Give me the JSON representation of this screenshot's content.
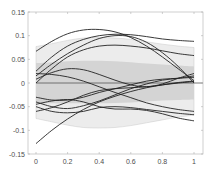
{
  "chart_data": {
    "type": "line",
    "title": "",
    "xlabel": "",
    "ylabel": "",
    "xlim": [
      0,
      1
    ],
    "ylim": [
      -0.15,
      0.15
    ],
    "grid": false,
    "legend": null,
    "x_ticks": [
      "0",
      "0.2",
      "0.4",
      "0.6",
      "0.8",
      "1"
    ],
    "y_ticks": [
      "0.15",
      "0.1",
      "0.05",
      "0",
      "-0.05",
      "-0.1",
      "-0.15"
    ],
    "colors": {
      "outer_band": "#ececec",
      "inner_band": "#d4d4d4",
      "lines": "#222222",
      "zero_line": "#555555",
      "axis": "#b0b0b0"
    },
    "x": [
      0,
      0.1,
      0.2,
      0.3,
      0.4,
      0.5,
      0.6,
      0.7,
      0.8,
      0.9,
      1.0
    ],
    "bands": {
      "outer_upper": [
        0.077,
        0.083,
        0.09,
        0.095,
        0.096,
        0.095,
        0.092,
        0.087,
        0.082,
        0.078,
        0.075
      ],
      "inner_upper": [
        0.042,
        0.044,
        0.046,
        0.047,
        0.047,
        0.046,
        0.044,
        0.041,
        0.039,
        0.037,
        0.035
      ],
      "inner_lower": [
        -0.042,
        -0.043,
        -0.043,
        -0.043,
        -0.043,
        -0.042,
        -0.041,
        -0.039,
        -0.037,
        -0.036,
        -0.035
      ],
      "outer_lower": [
        -0.075,
        -0.082,
        -0.089,
        -0.094,
        -0.095,
        -0.094,
        -0.09,
        -0.084,
        -0.078,
        -0.072,
        -0.068
      ]
    },
    "series": [
      {
        "name": "curve-1",
        "values": [
          0.067,
          0.088,
          0.104,
          0.112,
          0.113,
          0.108,
          0.096,
          0.078,
          0.055,
          0.03,
          0.005
        ]
      },
      {
        "name": "curve-2",
        "values": [
          0.025,
          0.055,
          0.078,
          0.092,
          0.1,
          0.103,
          0.102,
          0.098,
          0.093,
          0.09,
          0.088
        ]
      },
      {
        "name": "curve-3",
        "values": [
          0.015,
          0.04,
          0.062,
          0.08,
          0.094,
          0.1,
          0.098,
          0.086,
          0.064,
          0.035,
          0.0
        ]
      },
      {
        "name": "curve-4",
        "values": [
          0.0,
          0.03,
          0.055,
          0.07,
          0.078,
          0.08,
          0.078,
          0.074,
          0.068,
          0.062,
          0.058
        ]
      },
      {
        "name": "curve-5",
        "values": [
          0.02,
          0.018,
          0.013,
          0.004,
          -0.008,
          -0.02,
          -0.031,
          -0.042,
          -0.05,
          -0.056,
          -0.06
        ]
      },
      {
        "name": "curve-6",
        "values": [
          0.008,
          0.022,
          0.03,
          0.028,
          0.018,
          0.006,
          -0.004,
          -0.008,
          -0.002,
          0.01,
          0.02
        ]
      },
      {
        "name": "curve-7",
        "values": [
          -0.03,
          -0.036,
          -0.036,
          -0.03,
          -0.02,
          -0.012,
          -0.004,
          0.004,
          0.008,
          0.01,
          0.012
        ]
      },
      {
        "name": "curve-8",
        "values": [
          -0.04,
          -0.05,
          -0.054,
          -0.048,
          -0.038,
          -0.025,
          -0.012,
          -0.002,
          0.006,
          0.01,
          0.015
        ]
      },
      {
        "name": "curve-9",
        "values": [
          -0.045,
          -0.038,
          -0.035,
          -0.04,
          -0.05,
          -0.055,
          -0.055,
          -0.058,
          -0.065,
          -0.074,
          -0.08
        ]
      },
      {
        "name": "curve-10",
        "values": [
          -0.05,
          -0.06,
          -0.063,
          -0.06,
          -0.052,
          -0.05,
          -0.052,
          -0.056,
          -0.06,
          -0.064,
          -0.067
        ]
      },
      {
        "name": "curve-11",
        "values": [
          -0.06,
          -0.052,
          -0.04,
          -0.026,
          -0.016,
          -0.012,
          -0.01,
          -0.008,
          -0.004,
          0.0,
          0.003
        ]
      },
      {
        "name": "curve-12",
        "values": [
          -0.128,
          -0.1,
          -0.076,
          -0.056,
          -0.04,
          -0.028,
          -0.018,
          -0.01,
          -0.004,
          0.001,
          0.004
        ]
      }
    ]
  }
}
